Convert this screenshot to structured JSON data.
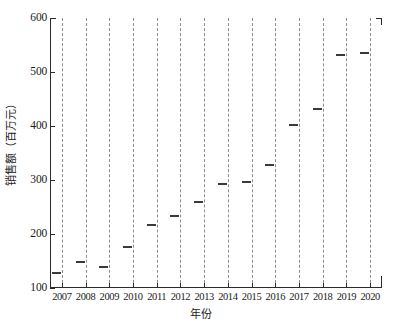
{
  "chart_data": {
    "type": "scatter",
    "title": "",
    "xlabel": "年份",
    "ylabel": "销售额（百万元）",
    "categories": [
      "2007",
      "2008",
      "2009",
      "2010",
      "2011",
      "2012",
      "2013",
      "2014",
      "2015",
      "2016",
      "2017",
      "2018",
      "2019",
      "2020"
    ],
    "values": [
      130,
      150,
      141,
      177,
      218,
      236,
      261,
      295,
      299,
      330,
      404,
      433,
      533,
      537
    ],
    "x": [
      2007,
      2008,
      2009,
      2010,
      2011,
      2012,
      2013,
      2014,
      2015,
      2016,
      2017,
      2018,
      2019,
      2020
    ],
    "xlim": [
      2006.5,
      2020.5
    ],
    "ylim": [
      100,
      600
    ],
    "ytick_labels": [
      "100",
      "200",
      "300",
      "400",
      "500",
      "600"
    ],
    "ytick_values": [
      100,
      200,
      300,
      400,
      500,
      600
    ],
    "xtick_labels": [
      "2007",
      "2008",
      "2009",
      "2010",
      "2011",
      "2012",
      "2013",
      "2014",
      "2015",
      "2016",
      "2017",
      "2018",
      "2019",
      "2020"
    ],
    "grid": "vertical-dashed",
    "legend": null,
    "marker_style": "horizontal-dash",
    "marker_color": "#3a3a3a",
    "grid_color": "#8e8e8e",
    "axis_color": "#2b2b2b",
    "background_color": "#ffffff"
  },
  "axes": {
    "y_title": "销售额（百万元）",
    "x_title": "年份"
  }
}
